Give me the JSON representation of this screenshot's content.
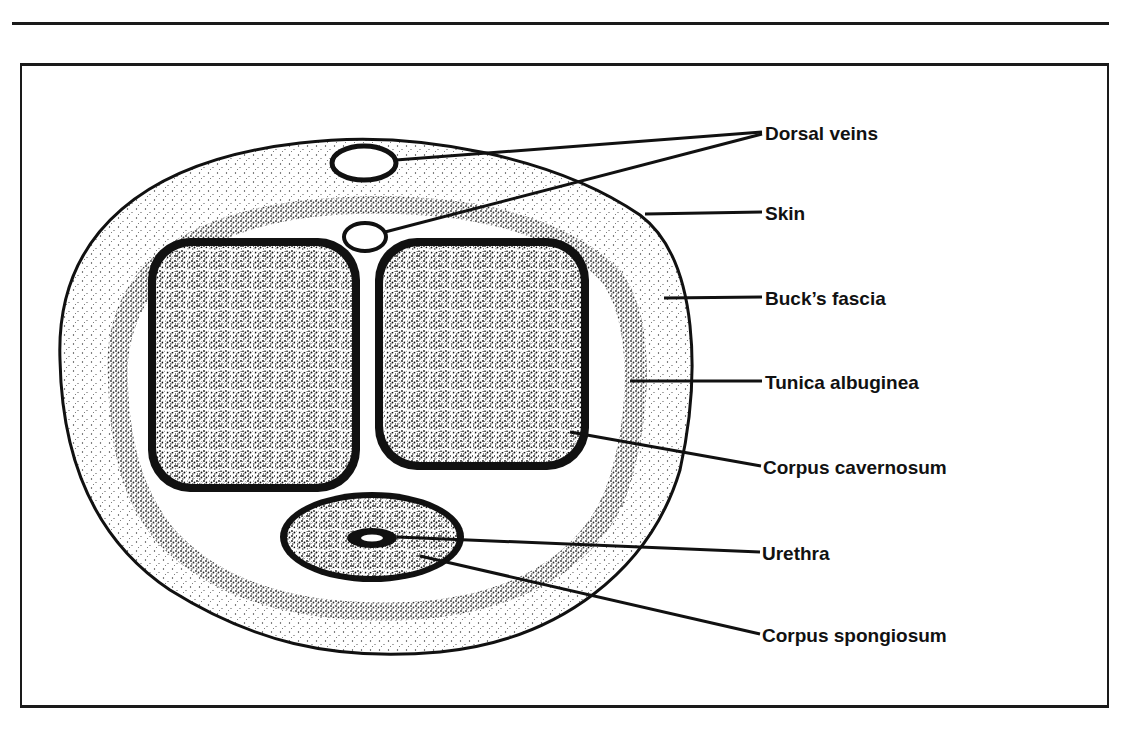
{
  "diagram": {
    "type": "anatomical cross-section",
    "labels": [
      {
        "id": "dorsal-veins",
        "text": "Dorsal veins",
        "x": 765,
        "y": 124
      },
      {
        "id": "skin",
        "text": "Skin",
        "x": 765,
        "y": 204
      },
      {
        "id": "bucks-fascia",
        "text": "Buck’s fascia",
        "x": 765,
        "y": 289
      },
      {
        "id": "tunica-albuginea",
        "text": "Tunica albuginea",
        "x": 765,
        "y": 373
      },
      {
        "id": "corpus-cavernosum",
        "text": "Corpus cavernosum",
        "x": 763,
        "y": 458
      },
      {
        "id": "urethra",
        "text": "Urethra",
        "x": 762,
        "y": 544
      },
      {
        "id": "corpus-spongiosum",
        "text": "Corpus spongiosum",
        "x": 762,
        "y": 626
      }
    ],
    "colors": {
      "ink": "#111111",
      "background": "#ffffff"
    }
  }
}
